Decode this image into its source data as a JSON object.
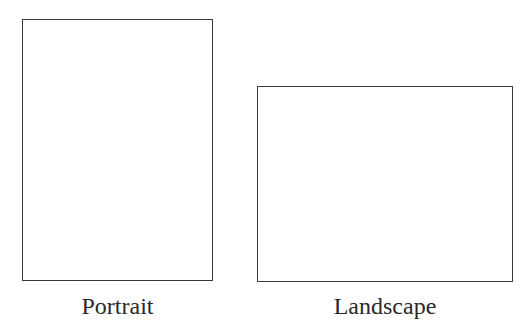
{
  "figure": {
    "items": [
      {
        "label": "Portrait",
        "orientation": "portrait",
        "box": {
          "x": 22,
          "y": 19,
          "width": 191,
          "height": 262
        }
      },
      {
        "label": "Landscape",
        "orientation": "landscape",
        "box": {
          "x": 257,
          "y": 86,
          "width": 256,
          "height": 196
        }
      }
    ],
    "colors": {
      "background": "#ffffff",
      "stroke": "#3a3a3a",
      "text": "#2a2a2a"
    }
  }
}
